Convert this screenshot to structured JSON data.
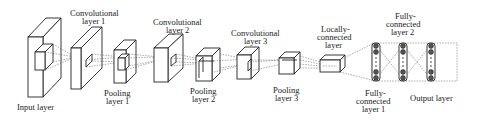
{
  "diagram": {
    "type": "cnn-architecture",
    "colors": {
      "stroke": "#222222",
      "background": "#ffffff",
      "node_fill": "#555555"
    },
    "layers": [
      {
        "id": "input",
        "label_lines": [
          "Input layer"
        ],
        "shape": "slab"
      },
      {
        "id": "conv1",
        "label_lines": [
          "Convolutional",
          "layer 1"
        ],
        "shape": "slab"
      },
      {
        "id": "pool1",
        "label_lines": [
          "Pooling",
          "layer 1"
        ],
        "shape": "slab"
      },
      {
        "id": "conv2",
        "label_lines": [
          "Convolutional",
          "layer 2"
        ],
        "shape": "slab"
      },
      {
        "id": "pool2",
        "label_lines": [
          "Pooling",
          "layer 2"
        ],
        "shape": "box"
      },
      {
        "id": "conv3",
        "label_lines": [
          "Convolutional",
          "layer 3"
        ],
        "shape": "box"
      },
      {
        "id": "pool3",
        "label_lines": [
          "Pooling",
          "layer 3"
        ],
        "shape": "box"
      },
      {
        "id": "local",
        "label_lines": [
          "Locally-",
          "connected",
          "layer"
        ],
        "shape": "small-box"
      },
      {
        "id": "fc1",
        "label_lines": [
          "Fully-",
          "connected",
          "layer 1"
        ],
        "shape": "node-column"
      },
      {
        "id": "fc2",
        "label_lines": [
          "Fully-",
          "connected",
          "layer 2"
        ],
        "shape": "node-column"
      },
      {
        "id": "output",
        "label_lines": [
          "Output layer"
        ],
        "shape": "node-column"
      }
    ]
  },
  "labels": {
    "input": "Input layer",
    "conv1_a": "Convolutional",
    "conv1_b": "layer 1",
    "pool1_a": "Pooling",
    "pool1_b": "layer 1",
    "conv2_a": "Convolutional",
    "conv2_b": "layer 2",
    "pool2_a": "Pooling",
    "pool2_b": "layer 2",
    "conv3_a": "Convolutional",
    "conv3_b": "layer 3",
    "pool3_a": "Pooling",
    "pool3_b": "layer 3",
    "local_a": "Locally-",
    "local_b": "connected",
    "local_c": "layer",
    "fc1_a": "Fully-",
    "fc1_b": "connected",
    "fc1_c": "layer 1",
    "fc2_a": "Fully-",
    "fc2_b": "connected",
    "fc2_c": "layer 2",
    "output": "Output layer"
  }
}
